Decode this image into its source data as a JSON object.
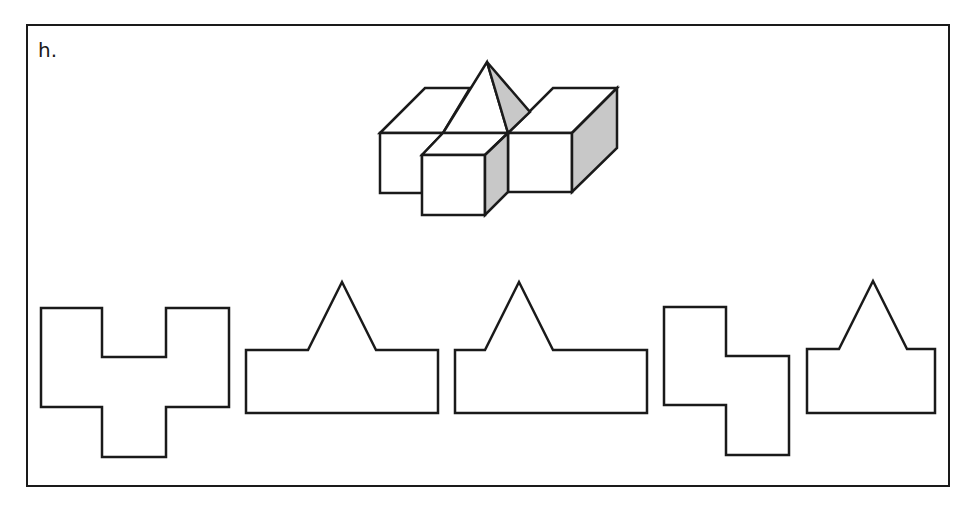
{
  "problem": {
    "label": "h.",
    "description": "3D solid made of cubes/blocks with a pyramid on top; five 2D views (candidate projections) shown below"
  },
  "colors": {
    "stroke": "#1a1a1a",
    "shade": "#c8c8c8",
    "background": "#ffffff"
  },
  "solid": {
    "name": "isometric-solid",
    "faces": [
      {
        "name": "left-block-top",
        "points": "380,133 425,88 470,88 443,133",
        "fill": "#ffffff"
      },
      {
        "name": "left-block-front",
        "points": "380,133 443,133 422,155 422,193 380,193",
        "fill": "#ffffff"
      },
      {
        "name": "right-block-top",
        "points": "508,133 553,88 617,88 572,133",
        "fill": "#ffffff"
      },
      {
        "name": "right-block-front",
        "points": "508,133 572,133 572,192 508,192",
        "fill": "#ffffff"
      },
      {
        "name": "right-block-side",
        "points": "572,133 617,88 617,148 572,192",
        "fill": "#c8c8c8"
      },
      {
        "name": "pyramid-front",
        "points": "487,62 443,133 508,133",
        "fill": "#ffffff"
      },
      {
        "name": "pyramid-side",
        "points": "487,62 530,112 508,133",
        "fill": "#c8c8c8"
      },
      {
        "name": "front-cube-top",
        "points": "422,155 443,133 508,133 485,155",
        "fill": "#ffffff"
      },
      {
        "name": "front-cube-front",
        "points": "422,155 485,155 485,215 422,215",
        "fill": "#ffffff"
      },
      {
        "name": "front-cube-side",
        "points": "485,155 508,133 508,192 485,215",
        "fill": "#c8c8c8"
      }
    ]
  },
  "views": [
    {
      "name": "view-1-cross-shape",
      "points": "41,308 102,308 102,357 166,357 166,308 229,308 229,407 166,407 166,457 102,457 102,407 41,407"
    },
    {
      "name": "view-2-house-shape",
      "points": "246,350 308,350 342,282 376,350 438,350 438,413 246,413"
    },
    {
      "name": "view-3-house-shape",
      "points": "455,350 485,350 519,282 553,350 647,350 647,413 455,413"
    },
    {
      "name": "view-4-step-shape",
      "points": "664,307 726,307 726,356 789,356 789,455 726,455 726,405 664,405"
    },
    {
      "name": "view-5-house-shape",
      "points": "807,349 839,349 873,281 907,349 935,349 935,413 807,413"
    }
  ]
}
